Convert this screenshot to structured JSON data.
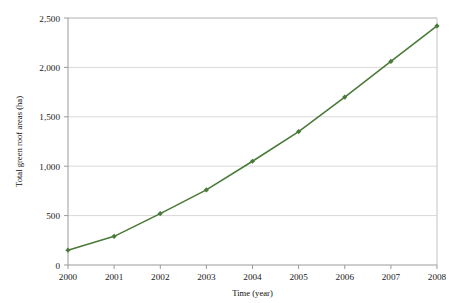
{
  "chart_data": {
    "type": "line",
    "title": "",
    "xlabel": "Time (year)",
    "ylabel": "Total green roof areas (ha)",
    "categories": [
      "2000",
      "2001",
      "2002",
      "2003",
      "2004",
      "2005",
      "2006",
      "2007",
      "2008"
    ],
    "x": [
      2000,
      2001,
      2002,
      2003,
      2004,
      2005,
      2006,
      2007,
      2008
    ],
    "values": [
      150,
      290,
      520,
      760,
      1050,
      1350,
      1700,
      2060,
      2420
    ],
    "series": [
      {
        "name": "Total green roof areas",
        "values": [
          150,
          290,
          520,
          760,
          1050,
          1350,
          1700,
          2060,
          2420
        ],
        "color": "#4a7a3a",
        "marker": "diamond",
        "line_width": 1.6
      }
    ],
    "xlim": [
      2000,
      2008
    ],
    "ylim": [
      0,
      2500
    ],
    "ytick_values": [
      0,
      500,
      1000,
      1500,
      2000,
      2500
    ],
    "ytick_labels": [
      "0",
      "500",
      "1,000",
      "1,500",
      "2,000",
      "2,500"
    ],
    "xtick_labels": [
      "2000",
      "2001",
      "2002",
      "2003",
      "2004",
      "2005",
      "2006",
      "2007",
      "2008"
    ],
    "grid": {
      "horizontal": true,
      "vertical": false,
      "color": "#d9d9d9"
    },
    "legend": {
      "visible": false,
      "position": "none"
    },
    "plot_border_color": "#bfbfbf",
    "background_color": "#ffffff"
  }
}
